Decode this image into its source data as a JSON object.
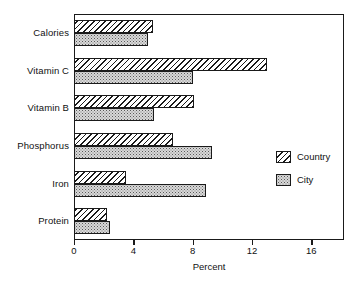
{
  "chart_data": {
    "type": "bar",
    "orientation": "horizontal",
    "title": "",
    "xlabel": "Percent",
    "ylabel": "",
    "categories": [
      "Calories",
      "Vitamin C",
      "Vitamin B",
      "Phosphorus",
      "Iron",
      "Protein"
    ],
    "series": [
      {
        "name": "Country",
        "values": [
          5.3,
          13.0,
          8.1,
          6.7,
          3.5,
          2.2
        ]
      },
      {
        "name": "City",
        "values": [
          5.0,
          8.0,
          5.4,
          9.3,
          8.9,
          2.4
        ]
      }
    ],
    "xlim": [
      0,
      18.2
    ],
    "xticks": [
      0,
      4,
      8,
      12,
      16
    ],
    "xtick_labels": [
      "0",
      "4",
      "8",
      "12",
      "16"
    ],
    "grid": false,
    "legend_position": "center-right",
    "legend_entries": [
      "Country",
      "City"
    ],
    "colors": {
      "country_fill": "#ffffff",
      "country_hatch": "#1a1a1a",
      "city_fill": "#d8d8d8",
      "city_stipple": "#5a5a5a",
      "frame": "#1a1a1a",
      "text": "#111111",
      "background": "#ffffff"
    }
  }
}
